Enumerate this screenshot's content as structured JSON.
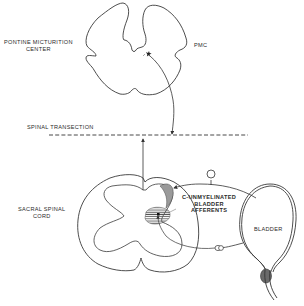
{
  "diagram": {
    "labels": {
      "pontine_line1": "PONTINE MICTURITION",
      "pontine_line2": "CENTER",
      "pmc": "PMC",
      "spinal_transection": "SPINAL TRANSECTION",
      "sacral_line1": "SACRAL SPINAL",
      "sacral_line2": "CORD",
      "afferents_line1": "C-UNMYELINATED",
      "afferents_line2": "BLADDER",
      "afferents_line3": "AFFERENTS",
      "bladder": "BLADDER"
    },
    "colors": {
      "ink": "#3a3a3a",
      "shading": "#8a8a8a",
      "background": "#ffffff"
    },
    "elements": [
      "pons-cross-section",
      "pmc-neuron",
      "descending-pathway",
      "spinal-transection-line",
      "ascending-pathway",
      "sacral-cord-cross-section",
      "gray-matter",
      "lamina-i-region",
      "hatched-region",
      "c-fiber-afferent",
      "dorsal-root-ganglion",
      "bladder",
      "urethra-sphincter"
    ]
  }
}
